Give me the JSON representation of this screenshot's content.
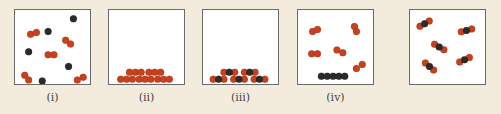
{
  "colors": {
    "background": "#f3ecdd",
    "oxygen_atom": "#c8401c",
    "carbon_atom": "#2b2b2b",
    "box_border": "#6b6b6b"
  },
  "legend_semantics": {
    "red_sphere": "oxygen atom",
    "black_sphere": "carbon atom"
  },
  "panels": [
    {
      "label": "(i)",
      "description": "Gas-phase mixture: separate black atoms and red diatomic molecules",
      "black_atoms": [
        [
          60,
          9
        ],
        [
          34,
          22
        ],
        [
          14,
          43
        ],
        [
          55,
          58
        ],
        [
          28,
          73
        ]
      ],
      "red_diatomics": [
        [
          16,
          25,
          22,
          23
        ],
        [
          52,
          31,
          57,
          35
        ],
        [
          34,
          46,
          40,
          46
        ],
        [
          10,
          67,
          14,
          72
        ],
        [
          64,
          72,
          70,
          69
        ]
      ]
    },
    {
      "label": "(ii)",
      "description": "Solid: red diatomic molecules stacked at bottom",
      "red_rows": [
        {
          "y": 64,
          "x": [
            21,
            27,
            33,
            41,
            47,
            53
          ]
        },
        {
          "y": 71,
          "x": [
            12,
            18,
            24,
            31,
            37,
            43,
            50,
            56,
            62
          ]
        }
      ]
    },
    {
      "label": "(iii)",
      "description": "Solid: red-black-red triatomic molecules stacked at bottom",
      "triatomic_rows": [
        {
          "y": 64,
          "centers": [
            27,
            48
          ]
        },
        {
          "y": 71,
          "centers": [
            16,
            37,
            58
          ]
        }
      ]
    },
    {
      "label": "(iv)",
      "description": "Red diatomic gas molecules above a row of solid black atoms",
      "red_diatomics": [
        [
          15,
          22,
          20,
          20
        ],
        [
          58,
          17,
          60,
          22
        ],
        [
          14,
          45,
          20,
          45
        ],
        [
          40,
          41,
          46,
          44
        ],
        [
          60,
          60,
          66,
          56
        ]
      ],
      "black_row": {
        "y": 68,
        "x": [
          24,
          30,
          36,
          42,
          48
        ]
      }
    },
    {
      "label": "",
      "description": "Gas-phase red-black-red triatomic molecules",
      "triatomics": [
        [
          15,
          14,
          -30
        ],
        [
          58,
          21,
          -15
        ],
        [
          30,
          38,
          30
        ],
        [
          56,
          51,
          -25
        ],
        [
          20,
          58,
          40
        ]
      ]
    }
  ]
}
